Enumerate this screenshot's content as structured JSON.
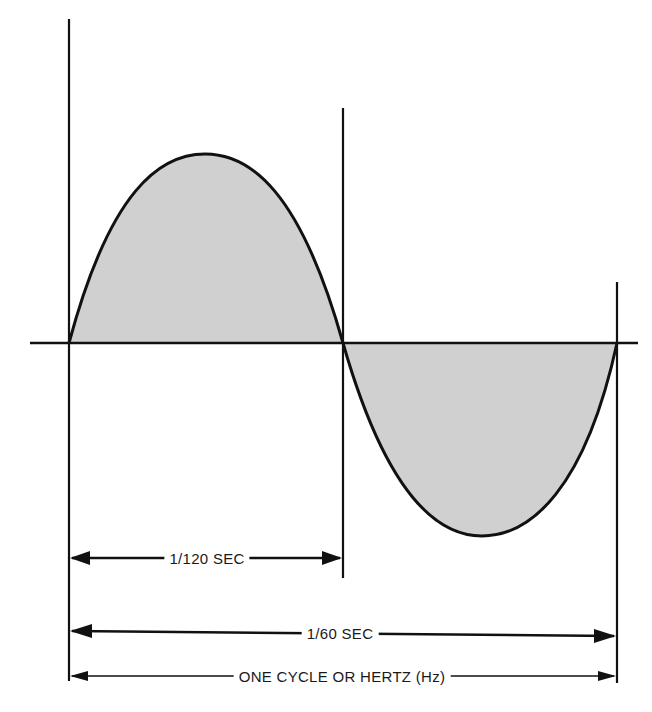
{
  "diagram": {
    "colors": {
      "line": "#111111",
      "fill": "#d0d0d0",
      "background": "#ffffff"
    },
    "waveform": {
      "type": "sine",
      "cycles": 1,
      "positive_half": "shaded",
      "negative_half": "shaded"
    },
    "labels": {
      "half_cycle": "1/120 SEC",
      "full_cycle": "1/60 SEC",
      "cycle_definition": "ONE CYCLE OR HERTZ (Hz)"
    }
  }
}
